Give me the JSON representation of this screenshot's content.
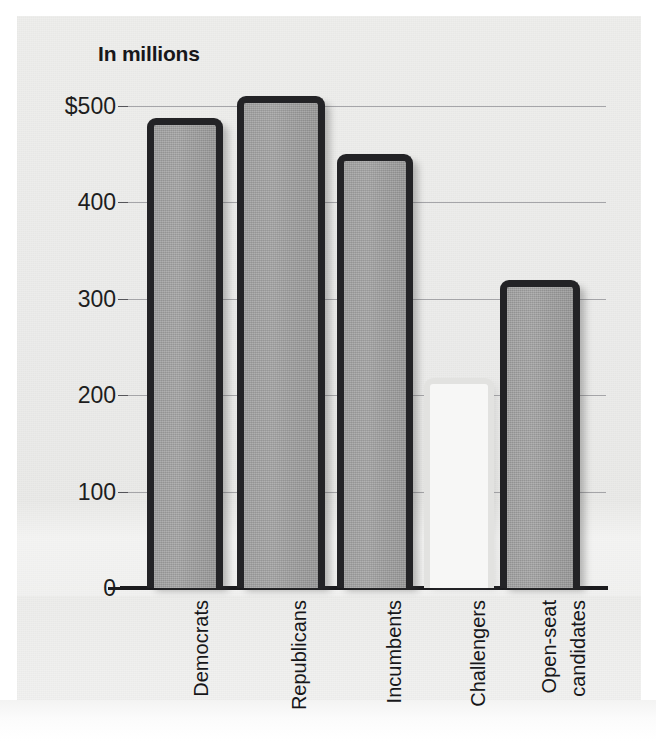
{
  "chart_data": {
    "type": "bar",
    "title": "In millions",
    "subtitle": "",
    "xlabel": "",
    "ylabel": "",
    "ylim": [
      0,
      500
    ],
    "yticks": [
      0,
      100,
      200,
      300,
      400,
      500
    ],
    "ytick_labels": [
      "0",
      "100",
      "200",
      "300",
      "400",
      "$500"
    ],
    "grid": true,
    "legend": false,
    "categories": [
      "Democrats",
      "Republicans",
      "Incumbents",
      "Challengers",
      "Open-seat candidates"
    ],
    "values": [
      488,
      510,
      450,
      218,
      320
    ],
    "bar_styles": [
      "filled",
      "filled",
      "filled",
      "hollow",
      "filled"
    ],
    "units": "millions of dollars",
    "annotations": []
  },
  "axis": {
    "y_ticks": [
      {
        "label": "$500",
        "value": 500
      },
      {
        "label": "400",
        "value": 400
      },
      {
        "label": "300",
        "value": 300
      },
      {
        "label": "200",
        "value": 200
      },
      {
        "label": "100",
        "value": 100
      },
      {
        "label": "0",
        "value": 0
      }
    ],
    "x_categories": [
      {
        "label": "Democrats",
        "lines": [
          "Democrats"
        ]
      },
      {
        "label": "Republicans",
        "lines": [
          "Republicans"
        ]
      },
      {
        "label": "Incumbents",
        "lines": [
          "Incumbents"
        ]
      },
      {
        "label": "Challengers",
        "lines": [
          "Challengers"
        ]
      },
      {
        "label": "Open-seat candidates",
        "lines": [
          "Open-seat",
          "candidates"
        ]
      }
    ]
  },
  "colors": {
    "bar_fill": "#9d9d9d",
    "bar_outline": "#232326",
    "hollow_fill": "#f7f7f6",
    "hollow_outline": "#e2e2e0",
    "gridline": "#8e8e93",
    "baseline": "#1b1b1e",
    "text": "#17171a",
    "page_background": "#ececeb"
  },
  "caption": {
    "cut_off_text": ""
  }
}
